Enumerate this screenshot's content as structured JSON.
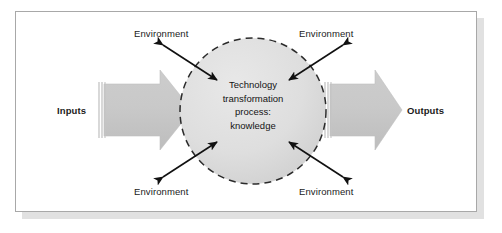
{
  "diagram": {
    "frame": {
      "border_color": "#a8a8a8",
      "background_color": "#ffffff",
      "shadow_color": "#c9c9c9"
    },
    "flow": {
      "input_label": "Inputs",
      "output_label": "Outputs",
      "arrow_fill_color": "#c6c6c6",
      "arrow_edge_color": "#b0b0b0"
    },
    "core": {
      "shape": "dashed-circle",
      "fill_color": "#dedede",
      "dash_color": "#2b2b2b",
      "lines": [
        "Technology",
        "transformation",
        "process:",
        "knowledge"
      ]
    },
    "environment_labels": [
      {
        "id": "top-left",
        "text": "Environment"
      },
      {
        "id": "top-right",
        "text": "Environment"
      },
      {
        "id": "bottom-left",
        "text": "Environment"
      },
      {
        "id": "bottom-right",
        "text": "Environment"
      }
    ],
    "exchange_arrows": {
      "count": 4,
      "style": "double-headed",
      "color": "#111111",
      "description": "bidirectional arrows crossing the dashed boundary at each diagonal"
    }
  }
}
